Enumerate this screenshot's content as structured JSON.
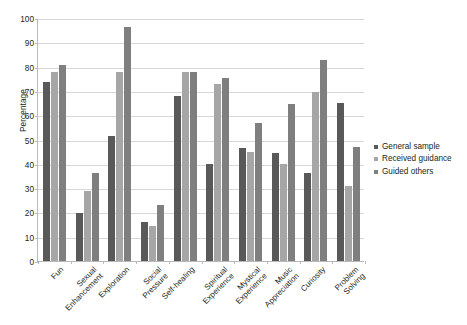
{
  "chart_data": {
    "type": "bar",
    "title": "",
    "xlabel": "",
    "ylabel": "Percentage",
    "ylim": [
      0,
      100
    ],
    "ytick_step": 10,
    "yticks": [
      0,
      10,
      20,
      30,
      40,
      50,
      60,
      70,
      80,
      90,
      100
    ],
    "grid": true,
    "legend_position": "right",
    "categories": [
      "Fun",
      "Sexual Enhancement",
      "Exploration",
      "Social Pressure",
      "Self-healing",
      "Spiritual Experience",
      "Mystical Experience",
      "Music Appreciation",
      "Curiosity",
      "Problem Solving"
    ],
    "series": [
      {
        "name": "General sample",
        "color": "#595959",
        "values": [
          74,
          20,
          51.5,
          16,
          68,
          40,
          46.5,
          44.5,
          36.5,
          65.5
        ]
      },
      {
        "name": "Received guidance",
        "color": "#a6a6a6",
        "values": [
          78,
          29,
          78,
          14.5,
          78,
          73,
          45,
          40,
          70,
          31
        ]
      },
      {
        "name": "Guided others",
        "color": "#7f7f7f",
        "values": [
          81,
          36.5,
          96.5,
          23,
          78,
          75.5,
          57,
          65,
          83,
          47
        ]
      }
    ]
  }
}
